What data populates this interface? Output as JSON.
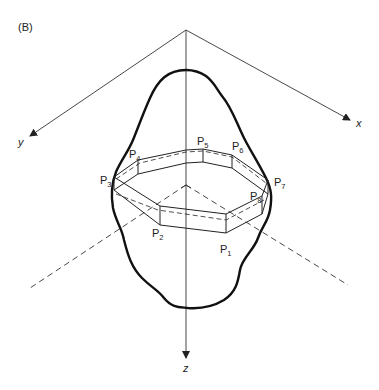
{
  "figure": {
    "panel_label": "(B)",
    "axes": {
      "x_label": "x",
      "y_label": "y",
      "z_label": "z",
      "origin": [
        186,
        30
      ]
    },
    "points": [
      {
        "id": "P1",
        "base": "P",
        "sub": "1",
        "pos": [
          226,
          250
        ]
      },
      {
        "id": "P2",
        "base": "P",
        "sub": "2",
        "pos": [
          152,
          236
        ]
      },
      {
        "id": "P3",
        "base": "P",
        "sub": "3",
        "pos": [
          100,
          183
        ]
      },
      {
        "id": "P4",
        "base": "P",
        "sub": "4",
        "pos": [
          130,
          157
        ]
      },
      {
        "id": "P5",
        "base": "P",
        "sub": "5",
        "pos": [
          197,
          143
        ]
      },
      {
        "id": "P6",
        "base": "P",
        "sub": "6",
        "pos": [
          232,
          148
        ]
      },
      {
        "id": "P7",
        "base": "P",
        "sub": "7",
        "pos": [
          274,
          186
        ]
      },
      {
        "id": "P8",
        "base": "P",
        "sub": "8",
        "pos": [
          249,
          199
        ]
      }
    ],
    "colors": {
      "line": "#222222",
      "background": "#ffffff"
    }
  }
}
